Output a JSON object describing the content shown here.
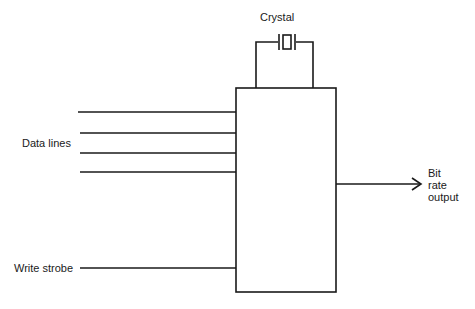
{
  "diagram": {
    "crystal_label": "Crystal",
    "data_lines_label": "Data lines",
    "write_strobe_label": "Write strobe",
    "output_label": [
      "Bit",
      "rate",
      "output"
    ],
    "line_color": "#1a1a1a",
    "components": {
      "block": "Baud rate generator block (unlabeled)",
      "crystal": "crystal-oscillator-symbol",
      "data_line_count": 4
    }
  }
}
